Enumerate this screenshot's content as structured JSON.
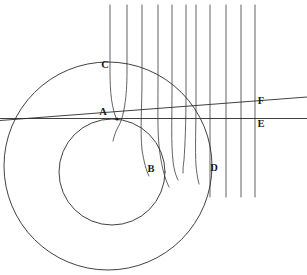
{
  "figure": {
    "stroke_color": "#2b2b2b",
    "background_color": "#ffffff",
    "width": 307,
    "height": 275,
    "labels": [
      {
        "id": "A",
        "text": "A",
        "x": 103,
        "y": 115
      },
      {
        "id": "B",
        "text": "B",
        "x": 151,
        "y": 172
      },
      {
        "id": "C",
        "text": "C",
        "x": 105,
        "y": 68
      },
      {
        "id": "D",
        "text": "D",
        "x": 214,
        "y": 171
      },
      {
        "id": "E",
        "text": "E",
        "x": 261,
        "y": 127
      },
      {
        "id": "F",
        "text": "F",
        "x": 261,
        "y": 104
      }
    ],
    "outer_circle": {
      "cx": 108,
      "cy": 166,
      "r": 104
    },
    "inner_circle": {
      "cx": 112,
      "cy": 172,
      "r": 53
    },
    "tangent_point": {
      "x": 117,
      "y": 119
    },
    "horizontal_line_E": {
      "x1": 0,
      "y1": 118,
      "x2": 307,
      "y2": 118
    },
    "slanted_line_F": {
      "x1": 0,
      "y1": 120,
      "x2": 307,
      "y2": 97
    },
    "vertical_ray_count": 10,
    "vertical_ray_x": [
      110,
      127,
      142,
      158,
      172,
      186,
      196,
      210,
      226,
      241,
      255
    ],
    "rays": [
      {
        "id": "ray-1",
        "d": "M110,5 L110,66 C110,86 111,104 117,119"
      },
      {
        "id": "ray-2",
        "d": "M127,5 L127,74 C127,100 122,128 114,140"
      },
      {
        "id": "ray-3",
        "d": "M142,5 L142,81 C142,112 143,145 148,175"
      },
      {
        "id": "ray-4",
        "d": "M158,5 L158,86 C158,118 160,152 167,186"
      },
      {
        "id": "ray-5",
        "d": "M172,5 L172,90 C172,122 172,154 175,179"
      },
      {
        "id": "ray-6",
        "d": "M186,5 L186,95 C186,126 185,155 184,172"
      },
      {
        "id": "ray-7",
        "d": "M196,5 L196,99 C196,128 195,158 197,182"
      },
      {
        "id": "ray-8",
        "d": "M210,5 L210,197"
      },
      {
        "id": "ray-9",
        "d": "M226,5 L226,197"
      },
      {
        "id": "ray-10",
        "d": "M241,5 L241,197"
      },
      {
        "id": "ray-axis",
        "d": "M255,5 L255,197"
      }
    ]
  }
}
